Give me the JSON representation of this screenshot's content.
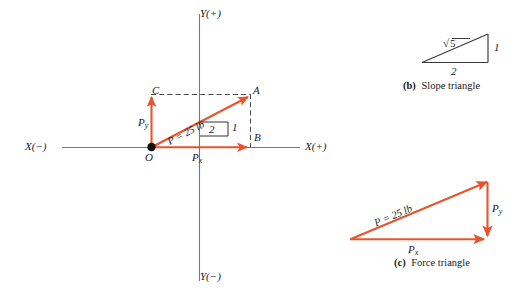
{
  "figure": {
    "vector_color": "#E8542B",
    "axis_color": "#6f6f6f",
    "line_color": "#3a3a3a"
  },
  "main_diagram": {
    "axis_labels": {
      "x_positive": "X(+)",
      "x_negative": "X(−)",
      "y_positive": "Y(+)",
      "y_negative": "Y(−)"
    },
    "points": {
      "origin": "O",
      "a": "A",
      "b": "B",
      "c": "C"
    },
    "vectors": {
      "resultant": "P = 25 lb",
      "resultant_p": "P",
      "resultant_value": "= 25 lb",
      "py": "P",
      "py_sub": "y",
      "px": "P",
      "px_sub": "x"
    },
    "slope_marks": {
      "rise": "1",
      "run": "2"
    }
  },
  "slope_triangle": {
    "caption_tag": "(b)",
    "caption_text": "Slope triangle",
    "hypotenuse": "5",
    "hypotenuse_radical": "√",
    "vertical": "1",
    "horizontal": "2"
  },
  "force_triangle": {
    "caption_tag": "(c)",
    "caption_text": "Force triangle",
    "hypotenuse": "P = 25 lb",
    "hypotenuse_p": "P",
    "hypotenuse_value": "= 25 lb",
    "vertical": "P",
    "vertical_sub": "y",
    "horizontal": "P",
    "horizontal_sub": "x"
  }
}
